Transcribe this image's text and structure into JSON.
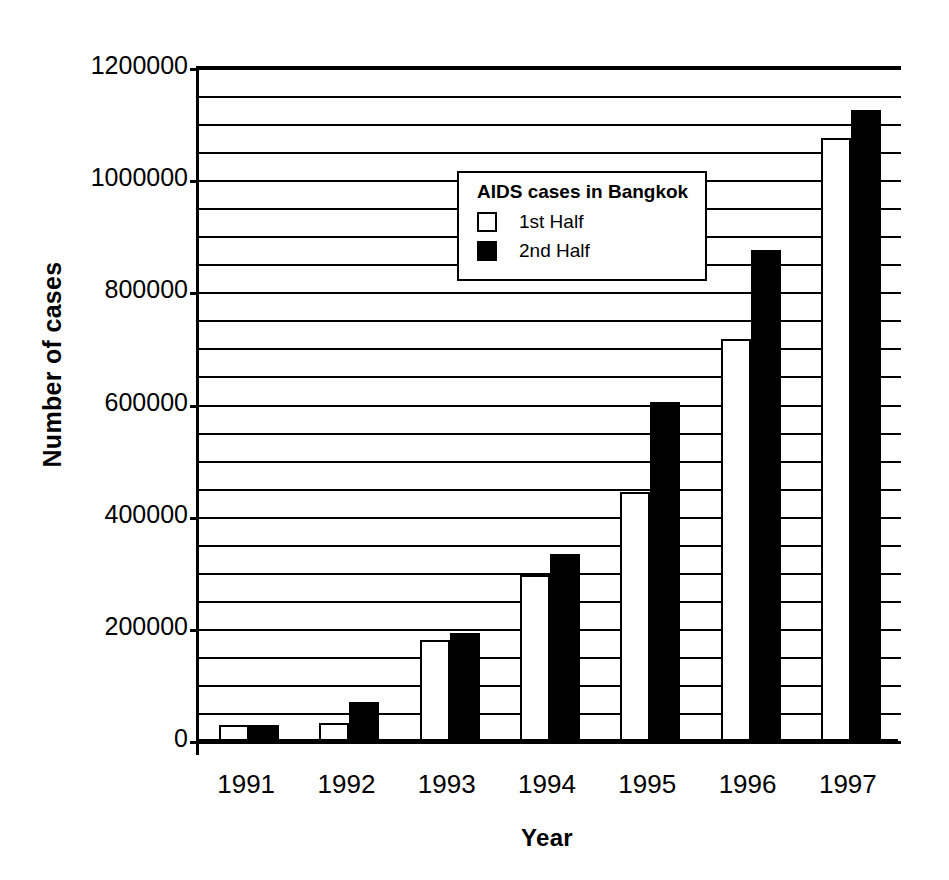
{
  "chart_data": {
    "type": "bar",
    "title": "",
    "xlabel": "Year",
    "ylabel": "Number of cases",
    "categories": [
      "1991",
      "1992",
      "1993",
      "1994",
      "1995",
      "1996",
      "1997"
    ],
    "series": [
      {
        "name": "1st Half",
        "color": "#ffffff",
        "values": [
          28000,
          32000,
          180000,
          296000,
          444000,
          717000,
          1076000
        ]
      },
      {
        "name": "2nd Half",
        "color": "#000000",
        "values": [
          28000,
          70000,
          193000,
          334000,
          604000,
          876000,
          1126000
        ]
      }
    ],
    "ylim": [
      0,
      1200000
    ],
    "y_major_ticks": [
      0,
      200000,
      400000,
      600000,
      800000,
      1000000,
      1200000
    ],
    "y_tick_labels": [
      "0",
      "200000",
      "400000",
      "600000",
      "800000",
      "1000000",
      "1200000"
    ],
    "y_minor_step": 50000,
    "grid": "horizontal",
    "legend_position": "upper-left-inside"
  },
  "legend": {
    "title": "AIDS cases in Bangkok",
    "entries": [
      {
        "label": "1st Half",
        "swatch": "white-square-swatch"
      },
      {
        "label": "2nd Half",
        "swatch": "black-square-swatch"
      }
    ]
  },
  "axes": {
    "y_title": "Number of cases",
    "x_title": "Year"
  }
}
